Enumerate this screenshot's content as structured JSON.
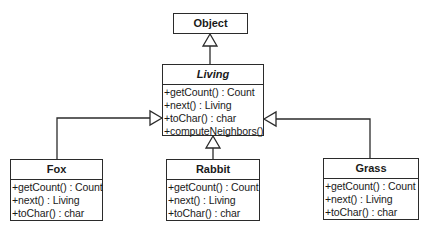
{
  "diagram": {
    "type": "uml-class-diagram",
    "classes": {
      "object": {
        "name": "Object",
        "abstract": false,
        "operations": []
      },
      "living": {
        "name": "Living",
        "abstract": true,
        "operations": [
          "+getCount() : Count",
          "+next() : Living",
          "+toChar() : char",
          "+computeNeighbors()"
        ]
      },
      "fox": {
        "name": "Fox",
        "abstract": false,
        "operations": [
          "+getCount() : Count",
          "+next() : Living",
          "+toChar() : char"
        ]
      },
      "rabbit": {
        "name": "Rabbit",
        "abstract": false,
        "operations": [
          "+getCount() : Count",
          "+next() : Living",
          "+toChar() : char"
        ]
      },
      "grass": {
        "name": "Grass",
        "abstract": false,
        "operations": [
          "+getCount() : Count",
          "+next() : Living",
          "+toChar() : char"
        ]
      }
    },
    "relationships": [
      {
        "type": "generalization",
        "from": "Living",
        "to": "Object"
      },
      {
        "type": "generalization",
        "from": "Fox",
        "to": "Living"
      },
      {
        "type": "generalization",
        "from": "Rabbit",
        "to": "Living"
      },
      {
        "type": "generalization",
        "from": "Grass",
        "to": "Living"
      }
    ],
    "colors": {
      "line": "#2b2b2b",
      "background": "#ffffff",
      "text": "#1a1a1a"
    }
  }
}
